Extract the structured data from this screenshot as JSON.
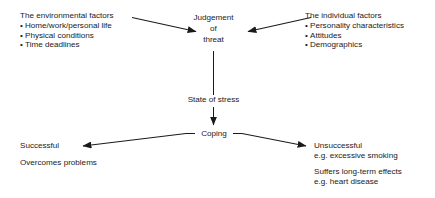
{
  "diagram": {
    "line_color": "#1a1a1a",
    "text_color": "#1a1a1a",
    "background": "#ffffff",
    "environmental": {
      "heading": "The environmental factors",
      "items": [
        "Home/work/personal life",
        "Physical conditions",
        "Time deadlines"
      ]
    },
    "individual": {
      "heading": "The individual factors",
      "items": [
        "Personality characteristics",
        "Attitudes",
        "Demographics"
      ]
    },
    "judgement": {
      "line1": "Judgement",
      "line2": "of",
      "line3": "threat"
    },
    "state_of_stress": "State of stress",
    "coping": "Coping",
    "successful": {
      "line1": "Successful",
      "line2": "Overcomes problems"
    },
    "unsuccessful": {
      "line1": "Unsuccessful",
      "line2": "e.g.  excessive smoking",
      "line3": "Suffers long-term effects",
      "line4": "e.g. heart disease"
    }
  }
}
